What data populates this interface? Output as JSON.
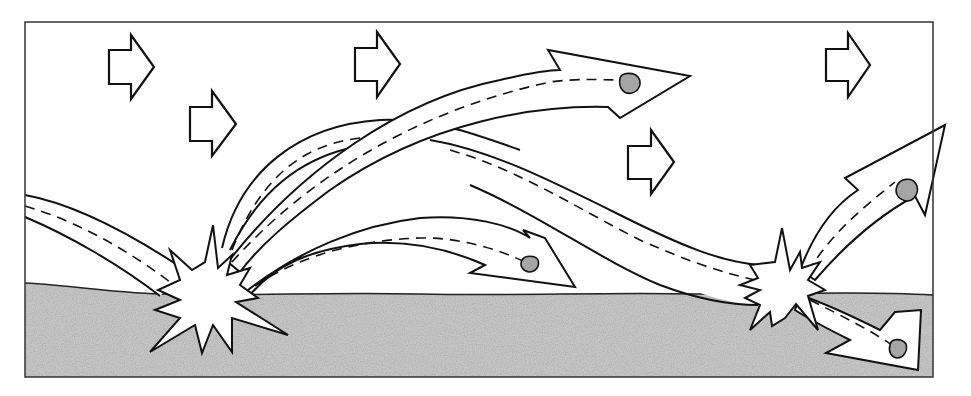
{
  "diagram": {
    "type": "saltation-illustration",
    "colors": {
      "line": "#111111",
      "sky": "#ffffff",
      "ground": "#b5b5b5",
      "ground_speckle": "#7a7a7a",
      "particle": "#9a9a9a"
    },
    "wind_arrows": [
      {
        "x": 109,
        "y": 35
      },
      {
        "x": 190,
        "y": 92
      },
      {
        "x": 355,
        "y": 32
      },
      {
        "x": 627,
        "y": 130
      },
      {
        "x": 826,
        "y": 33
      }
    ],
    "impacts": [
      {
        "label": "impact-left",
        "x": 205,
        "y": 305
      },
      {
        "x": 785,
        "y": 290,
        "label": "impact-right"
      }
    ],
    "particles": [
      {
        "x": 630,
        "y": 82
      },
      {
        "x": 530,
        "y": 264
      },
      {
        "x": 906,
        "y": 192
      },
      {
        "x": 896,
        "y": 347
      }
    ]
  }
}
